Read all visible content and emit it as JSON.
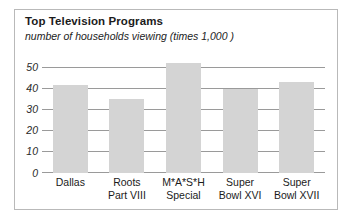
{
  "chart_data": {
    "type": "bar",
    "title": "Top Television Programs",
    "subtitle": "number of households viewing  (times  1,000 )",
    "xlabel": "",
    "ylabel": "",
    "ylim": [
      0,
      55
    ],
    "yticks": [
      50,
      40,
      30,
      20,
      10,
      0
    ],
    "grid": true,
    "legend": "none",
    "bar_color": "#d4d4d4",
    "categories": [
      "Dallas",
      "Roots Part VIII",
      "M*A*S*H Special",
      "Super Bowl XVI",
      "Super Bowl XVII"
    ],
    "category_lines": [
      {
        "line1": "Dallas",
        "line2": ""
      },
      {
        "line1": "Roots",
        "line2": "Part VIII"
      },
      {
        "line1": "M*A*S*H",
        "line2": "Special"
      },
      {
        "line1": "Super",
        "line2": "Bowl XVI"
      },
      {
        "line1": "Super",
        "line2": "Bowl XVII"
      }
    ],
    "values": [
      41.5,
      35,
      52,
      40,
      43
    ]
  }
}
